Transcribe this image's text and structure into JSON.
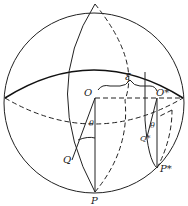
{
  "figure": {
    "type": "sphere-geometry",
    "labels": {
      "O": "O",
      "O_star": "O*",
      "P": "P",
      "P_star": "P*",
      "Q": "Q",
      "Q_star": "Q*",
      "theta_left": "θ",
      "theta_right": "θ",
      "xi": "ξ"
    }
  }
}
